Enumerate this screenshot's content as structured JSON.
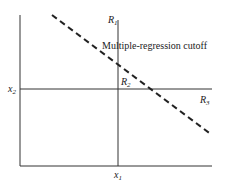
{
  "diagram": {
    "labels": {
      "r1": {
        "sym": "R",
        "sub": "1"
      },
      "r2": {
        "sym": "R",
        "sub": "2"
      },
      "r3": {
        "sym": "R",
        "sub": "3"
      },
      "x1": {
        "sym": "x",
        "sub": "1"
      },
      "x2": {
        "sym": "x",
        "sub": "2"
      },
      "cutoff": "Multiple-regression cutoff"
    },
    "colors": {
      "line": "#333333",
      "background": "#ffffff"
    }
  }
}
